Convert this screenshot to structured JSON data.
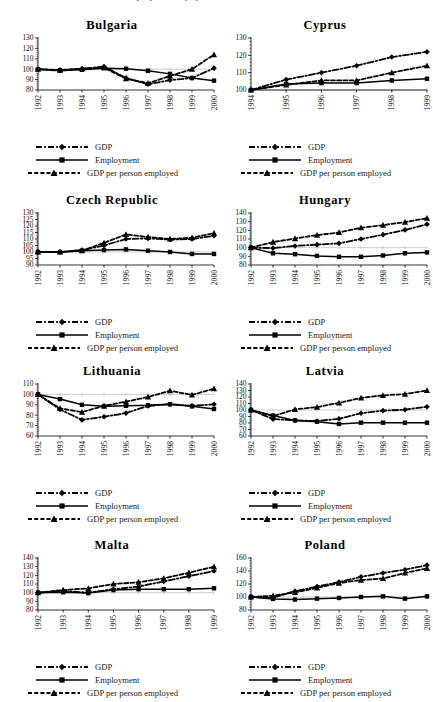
{
  "page": {
    "top_cut_text": "GDP per person employed"
  },
  "legend": {
    "gdp": "GDP",
    "employment": "Employment",
    "gdp_per_person": "GDP per person employed"
  },
  "series_names": {
    "gdp": "GDP",
    "employment": "Employment",
    "gdp_per_person_employed": "GDP per person employed"
  },
  "chart_data": [
    {
      "type": "line",
      "title": "Bulgaria",
      "xlabel": "",
      "ylabel": "",
      "grid": false,
      "legend_position": "below",
      "x": [
        "1992",
        "1993",
        "1994",
        "1995",
        "1996",
        "1997",
        "1998",
        "1999",
        "2000"
      ],
      "ylim": [
        80,
        130
      ],
      "yticks": [
        80,
        90,
        100,
        110,
        120,
        130
      ],
      "series": [
        {
          "name": "GDP",
          "marker": "diamond",
          "line": "dashdot",
          "values": [
            100,
            98.6,
            100.4,
            102.5,
            91.5,
            85.5,
            89.5,
            91.5,
            101
          ]
        },
        {
          "name": "Employment",
          "marker": "square",
          "line": "solid",
          "values": [
            100,
            99,
            99.4,
            101,
            100.5,
            98.5,
            95.5,
            91.5,
            89
          ]
        },
        {
          "name": "GDP per person employed",
          "marker": "triangle",
          "line": "dashed",
          "values": [
            100,
            99.2,
            100.5,
            101.5,
            91,
            86.5,
            93.5,
            100,
            114
          ]
        }
      ]
    },
    {
      "type": "line",
      "title": "Cyprus",
      "xlabel": "",
      "ylabel": "",
      "grid": false,
      "legend_position": "below",
      "x": [
        "1994",
        "1995",
        "1996",
        "1997",
        "1998",
        "1999"
      ],
      "ylim": [
        100,
        130
      ],
      "yticks": [
        100,
        110,
        120,
        130
      ],
      "series": [
        {
          "name": "GDP",
          "marker": "diamond",
          "line": "dashdot",
          "values": [
            100,
            106,
            110,
            114,
            119,
            122
          ]
        },
        {
          "name": "Employment",
          "marker": "square",
          "line": "solid",
          "values": [
            100,
            103.5,
            104,
            104,
            105.5,
            106.5
          ]
        },
        {
          "name": "GDP per person employed",
          "marker": "triangle",
          "line": "dashed",
          "values": [
            100,
            103,
            105.5,
            105.5,
            110,
            114
          ]
        }
      ]
    },
    {
      "type": "line",
      "title": "Czech Republic",
      "xlabel": "",
      "ylabel": "",
      "grid": false,
      "legend_position": "below",
      "x": [
        "1992",
        "1993",
        "1994",
        "1995",
        "1996",
        "1997",
        "1998",
        "1999",
        "2000"
      ],
      "ylim": [
        90,
        130
      ],
      "yticks": [
        90,
        95,
        100,
        105,
        110,
        115,
        120,
        125,
        130
      ],
      "series": [
        {
          "name": "GDP",
          "marker": "diamond",
          "line": "dashdot",
          "values": [
            100,
            100,
            101.5,
            105,
            110,
            110.5,
            109.5,
            110,
            112.5
          ]
        },
        {
          "name": "Employment",
          "marker": "square",
          "line": "solid",
          "values": [
            100,
            100,
            101,
            101.5,
            102,
            101,
            100,
            98.5,
            98.5
          ]
        },
        {
          "name": "GDP per person employed",
          "marker": "triangle",
          "line": "dashed",
          "values": [
            100,
            100,
            101,
            107,
            113.5,
            111.5,
            110,
            111,
            114.5
          ]
        }
      ]
    },
    {
      "type": "line",
      "title": "Hungary",
      "xlabel": "",
      "ylabel": "",
      "grid": false,
      "legend_position": "below",
      "x": [
        "1992",
        "1993",
        "1994",
        "1995",
        "1996",
        "1997",
        "1998",
        "1999",
        "2000"
      ],
      "ylim": [
        80,
        140
      ],
      "yticks": [
        80,
        90,
        100,
        110,
        120,
        130,
        140
      ],
      "series": [
        {
          "name": "GDP",
          "marker": "diamond",
          "line": "dashdot",
          "values": [
            100,
            99.5,
            102,
            103.5,
            105,
            110,
            115,
            120.5,
            127
          ]
        },
        {
          "name": "Employment",
          "marker": "square",
          "line": "solid",
          "values": [
            100,
            93.5,
            92.5,
            90.5,
            89.5,
            89.5,
            91,
            93.5,
            94.5
          ]
        },
        {
          "name": "GDP per person employed",
          "marker": "triangle",
          "line": "dashed",
          "values": [
            100,
            106.5,
            110.5,
            114.5,
            117.5,
            123,
            126,
            129.5,
            134
          ]
        }
      ]
    },
    {
      "type": "line",
      "title": "Lithuania",
      "xlabel": "",
      "ylabel": "",
      "grid": false,
      "legend_position": "below",
      "x": [
        "1992",
        "1993",
        "1994",
        "1995",
        "1996",
        "1997",
        "1998",
        "1999",
        "2000"
      ],
      "ylim": [
        60,
        110
      ],
      "yticks": [
        60,
        70,
        80,
        90,
        100,
        110
      ],
      "series": [
        {
          "name": "GDP",
          "marker": "diamond",
          "line": "dashdot",
          "values": [
            100,
            85.5,
            75.5,
            78.5,
            82,
            89,
            90.5,
            89,
            90.5
          ]
        },
        {
          "name": "Employment",
          "marker": "square",
          "line": "solid",
          "values": [
            100,
            95.5,
            90,
            88.5,
            89,
            89.5,
            90.5,
            88.5,
            86
          ]
        },
        {
          "name": "GDP per person employed",
          "marker": "triangle",
          "line": "dashed",
          "values": [
            100,
            86.5,
            83,
            89,
            93,
            97.5,
            103.5,
            99.5,
            105.5
          ]
        }
      ]
    },
    {
      "type": "line",
      "title": "Latvia",
      "xlabel": "",
      "ylabel": "",
      "grid": false,
      "legend_position": "below",
      "x": [
        "1992",
        "1993",
        "1994",
        "1995",
        "1996",
        "1997",
        "1998",
        "1999",
        "2000"
      ],
      "ylim": [
        60,
        140
      ],
      "yticks": [
        60,
        70,
        80,
        90,
        100,
        110,
        120,
        130,
        140
      ],
      "series": [
        {
          "name": "GDP",
          "marker": "diamond",
          "line": "dashdot",
          "values": [
            100,
            86,
            84,
            83,
            86.5,
            95,
            99,
            100.5,
            105
          ]
        },
        {
          "name": "Employment",
          "marker": "square",
          "line": "solid",
          "values": [
            100,
            91.5,
            84,
            82,
            78.5,
            80.5,
            80.5,
            80.5,
            80.5
          ]
        },
        {
          "name": "GDP per person employed",
          "marker": "triangle",
          "line": "dashed",
          "values": [
            100,
            90.5,
            101,
            104.5,
            111,
            118.5,
            122.5,
            124.5,
            130
          ]
        }
      ]
    },
    {
      "type": "line",
      "title": "Malta",
      "xlabel": "",
      "ylabel": "",
      "grid": false,
      "legend_position": "below",
      "x": [
        "1992",
        "1993",
        "1994",
        "1995",
        "1996",
        "1997",
        "1998",
        "1999"
      ],
      "ylim": [
        80,
        140
      ],
      "yticks": [
        80,
        90,
        100,
        110,
        120,
        130,
        140
      ],
      "series": [
        {
          "name": "GDP",
          "marker": "diamond",
          "line": "dashdot",
          "values": [
            100,
            102,
            100,
            104,
            107,
            113,
            119,
            125
          ]
        },
        {
          "name": "Employment",
          "marker": "square",
          "line": "solid",
          "values": [
            100,
            100.5,
            99.5,
            103,
            104,
            104,
            104,
            105
          ]
        },
        {
          "name": "GDP per person employed",
          "marker": "triangle",
          "line": "dashed",
          "values": [
            100,
            103,
            105,
            110,
            112,
            116.5,
            123,
            130
          ]
        }
      ]
    },
    {
      "type": "line",
      "title": "Poland",
      "xlabel": "",
      "ylabel": "",
      "grid": false,
      "legend_position": "below",
      "x": [
        "1992",
        "1993",
        "1994",
        "1995",
        "1996",
        "1997",
        "1998",
        "1999",
        "2000"
      ],
      "ylim": [
        80,
        160
      ],
      "yticks": [
        80,
        100,
        120,
        140,
        160
      ],
      "series": [
        {
          "name": "GDP",
          "marker": "diamond",
          "line": "dashdot",
          "values": [
            100,
            99,
            109,
            116,
            123,
            131,
            137,
            142,
            149
          ]
        },
        {
          "name": "Employment",
          "marker": "square",
          "line": "solid",
          "values": [
            100,
            97,
            96,
            97.5,
            98.5,
            100,
            101,
            97.5,
            101
          ]
        },
        {
          "name": "GDP per person employed",
          "marker": "triangle",
          "line": "dashed",
          "values": [
            100,
            102,
            107,
            114,
            121.5,
            126,
            128.5,
            137,
            144
          ]
        }
      ]
    }
  ]
}
